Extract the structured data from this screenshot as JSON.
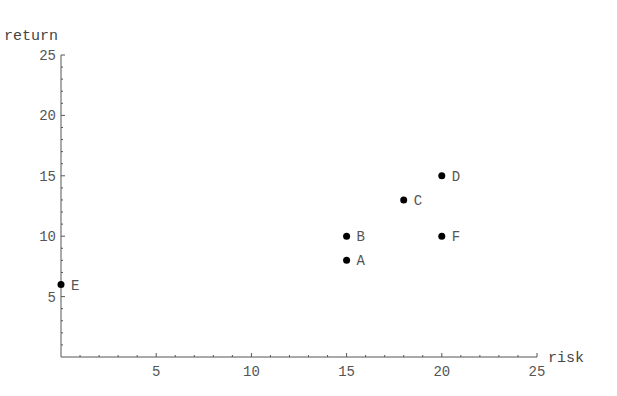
{
  "chart_data": {
    "type": "scatter",
    "title": "",
    "xlabel": "risk",
    "ylabel": "return",
    "xlim": [
      0,
      25
    ],
    "ylim": [
      0,
      25
    ],
    "x_ticks": [
      5,
      10,
      15,
      20,
      25
    ],
    "y_ticks": [
      5,
      10,
      15,
      20,
      25
    ],
    "grid": false,
    "legend": null,
    "points": [
      {
        "label": "A",
        "x": 15,
        "y": 8
      },
      {
        "label": "B",
        "x": 15,
        "y": 10
      },
      {
        "label": "C",
        "x": 18,
        "y": 13
      },
      {
        "label": "D",
        "x": 20,
        "y": 15
      },
      {
        "label": "E",
        "x": 0,
        "y": 6
      },
      {
        "label": "F",
        "x": 20,
        "y": 10
      }
    ]
  },
  "colors": {
    "axis": "#555555",
    "point": "#000000",
    "text": "#555555"
  }
}
